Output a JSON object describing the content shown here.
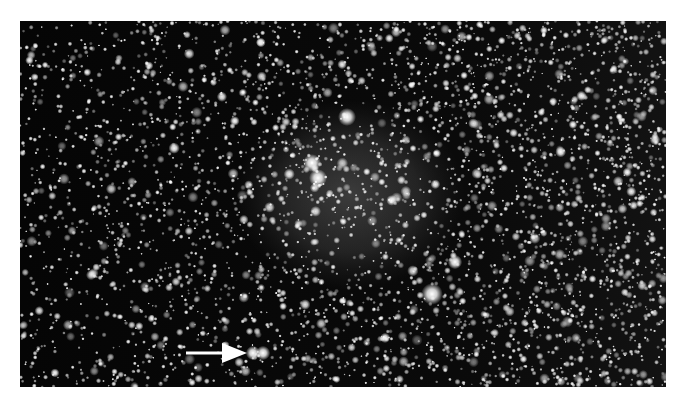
{
  "image": {
    "subject": "starfield with faint diffuse nebula",
    "colors": {
      "background": "#ffffff",
      "sky": "#050505",
      "nebula": "#6a6a6a",
      "stars": "#ffffff",
      "arrow": "#ffffff"
    },
    "frame": {
      "left": 20,
      "top": 21,
      "width": 646,
      "height": 366
    },
    "nebula": {
      "center_x": 350,
      "center_y": 195,
      "radius_x": 115,
      "radius_y": 95
    },
    "bright_stars": [
      {
        "x": 347,
        "y": 117,
        "r": 5
      },
      {
        "x": 312,
        "y": 163,
        "r": 5
      },
      {
        "x": 318,
        "y": 178,
        "r": 5
      },
      {
        "x": 455,
        "y": 262,
        "r": 4
      },
      {
        "x": 432,
        "y": 294,
        "r": 6
      },
      {
        "x": 253,
        "y": 353,
        "r": 4
      },
      {
        "x": 263,
        "y": 353,
        "r": 4
      }
    ],
    "arrow": {
      "label": "marked object",
      "shaft_x1": 186,
      "shaft_x2": 222,
      "y": 353,
      "head_tip_x": 247
    }
  }
}
